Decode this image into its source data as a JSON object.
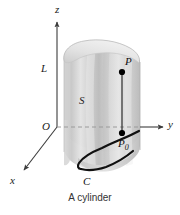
{
  "figure": {
    "caption": "A cylinder",
    "background_color": "#ffffff",
    "axes": {
      "z": {
        "label": "z",
        "direction": "up"
      },
      "y": {
        "label": "y",
        "direction": "right"
      },
      "x": {
        "label": "x",
        "direction": "down-left"
      }
    },
    "labels": {
      "origin": "O",
      "height": "L",
      "surface": "S",
      "curve": "C",
      "point_upper": "P",
      "point_base": "P",
      "point_base_subscript": "0"
    },
    "colors": {
      "axis": "#3c3c3c",
      "curve": "#111111",
      "dashed": "#9a9a9a",
      "surface_light": "#eeeeee",
      "surface_mid": "#d2d2d2",
      "surface_dark": "#b4b4b4",
      "point": "#000000",
      "text": "#1a1a1a"
    }
  }
}
